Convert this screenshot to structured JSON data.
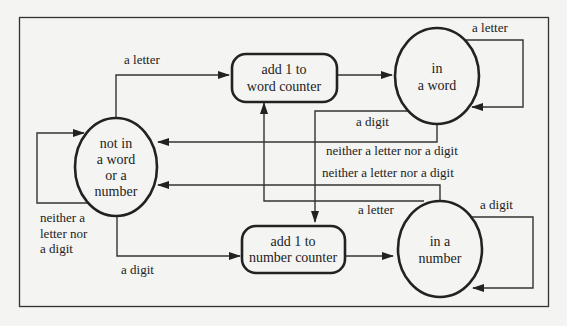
{
  "diagram": {
    "type": "state-diagram",
    "nodes": {
      "not_in": {
        "kind": "state",
        "lines": [
          "not in",
          "a word",
          "or a",
          "number"
        ]
      },
      "add_word": {
        "kind": "action",
        "lines": [
          "add 1 to",
          "word counter"
        ]
      },
      "in_word": {
        "kind": "state",
        "lines": [
          "in",
          "a word"
        ]
      },
      "add_number": {
        "kind": "action",
        "lines": [
          "add 1 to",
          "number counter"
        ]
      },
      "in_number": {
        "kind": "state",
        "lines": [
          "in a",
          "number"
        ]
      }
    },
    "edges": {
      "not_in_to_add_word": {
        "label": "a letter"
      },
      "add_word_to_in_word": {
        "label": ""
      },
      "in_word_self": {
        "label": "a letter"
      },
      "in_word_to_add_number": {
        "label": "a digit"
      },
      "in_word_to_not_in": {
        "label": "neither a letter nor a digit"
      },
      "in_number_to_not_in": {
        "label": "neither a letter nor a digit"
      },
      "in_number_to_add_word": {
        "label": "a letter"
      },
      "in_number_self": {
        "label": "a digit"
      },
      "not_in_self": {
        "label_lines": [
          "neither a",
          "letter nor",
          "a digit"
        ]
      },
      "not_in_to_add_number": {
        "label": "a digit"
      },
      "add_number_to_in_number": {
        "label": ""
      }
    }
  }
}
